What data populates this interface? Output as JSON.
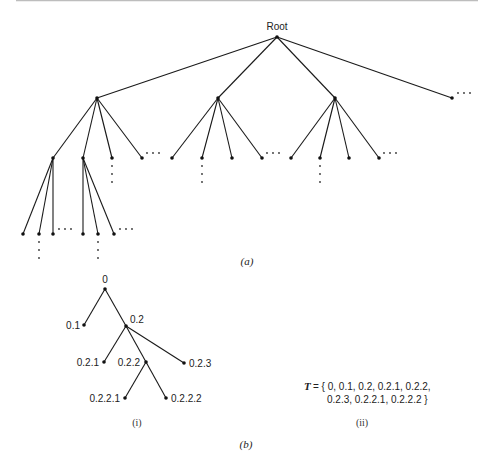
{
  "figure_a": {
    "caption": "(a)",
    "root_label": "Root",
    "nodes": [
      {
        "id": "root",
        "x": 277,
        "y": 37
      },
      {
        "id": "A",
        "x": 97,
        "y": 98
      },
      {
        "id": "B",
        "x": 218,
        "y": 98
      },
      {
        "id": "C",
        "x": 335,
        "y": 98
      },
      {
        "id": "D",
        "x": 452,
        "y": 98
      },
      {
        "id": "A1",
        "x": 53,
        "y": 158
      },
      {
        "id": "A2",
        "x": 83,
        "y": 158
      },
      {
        "id": "A3",
        "x": 112,
        "y": 158
      },
      {
        "id": "A4",
        "x": 142,
        "y": 158
      },
      {
        "id": "B1",
        "x": 172,
        "y": 158
      },
      {
        "id": "B2",
        "x": 202,
        "y": 158
      },
      {
        "id": "B3",
        "x": 232,
        "y": 158
      },
      {
        "id": "B4",
        "x": 262,
        "y": 158
      },
      {
        "id": "C1",
        "x": 291,
        "y": 158
      },
      {
        "id": "C2",
        "x": 320,
        "y": 158
      },
      {
        "id": "C3",
        "x": 349,
        "y": 158
      },
      {
        "id": "C4",
        "x": 379,
        "y": 158
      },
      {
        "id": "A1a",
        "x": 23,
        "y": 234
      },
      {
        "id": "A1b",
        "x": 39,
        "y": 234
      },
      {
        "id": "A1c",
        "x": 53,
        "y": 234
      },
      {
        "id": "A2a",
        "x": 83,
        "y": 234
      },
      {
        "id": "A2b",
        "x": 98,
        "y": 234
      },
      {
        "id": "A2c",
        "x": 114,
        "y": 234
      }
    ],
    "edges": [
      [
        "root",
        "A"
      ],
      [
        "root",
        "B"
      ],
      [
        "root",
        "C"
      ],
      [
        "root",
        "D"
      ],
      [
        "A",
        "A1"
      ],
      [
        "A",
        "A2"
      ],
      [
        "A",
        "A3"
      ],
      [
        "A",
        "A4"
      ],
      [
        "B",
        "B1"
      ],
      [
        "B",
        "B2"
      ],
      [
        "B",
        "B3"
      ],
      [
        "B",
        "B4"
      ],
      [
        "C",
        "C1"
      ],
      [
        "C",
        "C2"
      ],
      [
        "C",
        "C3"
      ],
      [
        "C",
        "C4"
      ],
      [
        "A1",
        "A1a"
      ],
      [
        "A1",
        "A1b"
      ],
      [
        "A1",
        "A1c"
      ],
      [
        "A2",
        "A2a"
      ],
      [
        "A2",
        "A2b"
      ],
      [
        "A2",
        "A2c"
      ]
    ],
    "h_ellipses": [
      {
        "x": 458,
        "y": 93
      },
      {
        "x": 147,
        "y": 153
      },
      {
        "x": 267,
        "y": 153
      },
      {
        "x": 384,
        "y": 153
      },
      {
        "x": 59,
        "y": 229
      },
      {
        "x": 120,
        "y": 229
      }
    ],
    "v_ellipses": [
      {
        "x": 112,
        "y": 166
      },
      {
        "x": 202,
        "y": 166
      },
      {
        "x": 320,
        "y": 166
      },
      {
        "x": 39,
        "y": 242
      },
      {
        "x": 98,
        "y": 242
      }
    ]
  },
  "figure_b": {
    "caption": "(b)",
    "subfigure_i_label": "(i)",
    "subfigure_ii_label": "(ii)",
    "nodes": [
      {
        "id": "0",
        "label": "0",
        "x": 105,
        "y": 289,
        "lx": 105,
        "ly": 283,
        "anchor": "middle"
      },
      {
        "id": "0.1",
        "label": "0.1",
        "x": 84,
        "y": 325,
        "lx": 80,
        "ly": 329,
        "anchor": "end"
      },
      {
        "id": "0.2",
        "label": "0.2",
        "x": 126,
        "y": 326,
        "lx": 130,
        "ly": 323,
        "anchor": "start"
      },
      {
        "id": "0.2.1",
        "label": "0.2.1",
        "x": 104,
        "y": 362,
        "lx": 99,
        "ly": 366,
        "anchor": "end"
      },
      {
        "id": "0.2.2",
        "label": "0.2.2",
        "x": 146,
        "y": 362,
        "lx": 140,
        "ly": 366,
        "anchor": "end"
      },
      {
        "id": "0.2.3",
        "label": "0.2.3",
        "x": 184,
        "y": 363,
        "lx": 189,
        "ly": 367,
        "anchor": "start"
      },
      {
        "id": "0.2.2.1",
        "label": "0.2.2.1",
        "x": 125,
        "y": 398,
        "lx": 120,
        "ly": 402,
        "anchor": "end"
      },
      {
        "id": "0.2.2.2",
        "label": "0.2.2.2",
        "x": 166,
        "y": 398,
        "lx": 171,
        "ly": 402,
        "anchor": "start"
      }
    ],
    "edges": [
      [
        "0",
        "0.1"
      ],
      [
        "0",
        "0.2"
      ],
      [
        "0.2",
        "0.2.1"
      ],
      [
        "0.2",
        "0.2.2"
      ],
      [
        "0.2",
        "0.2.3"
      ],
      [
        "0.2.2",
        "0.2.2.1"
      ],
      [
        "0.2.2",
        "0.2.2.2"
      ]
    ],
    "set_symbol": "T",
    "set_line1": "= { 0, 0.1, 0.2, 0.2.1, 0.2.2,",
    "set_line2": "0.2.3, 0.2.2.1, 0.2.2.2 }"
  }
}
